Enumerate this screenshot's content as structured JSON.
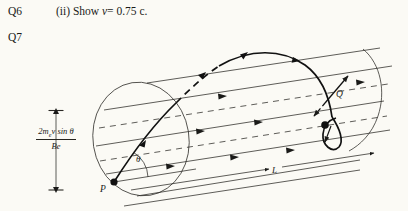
{
  "page": {
    "background_color": "#fbfaf5",
    "ink_color": "#1a1a18"
  },
  "questions": {
    "q6_label": "Q6",
    "q7_label": "Q7",
    "q6_part_prefix": "(ii) Show ",
    "q6_part_variable": "v",
    "q6_part_equals": "= 0.75 c."
  },
  "figure": {
    "formula": {
      "numerator_prefix": "2m",
      "numerator_subscript": "e",
      "numerator_suffix": "v sin θ",
      "denominator": "Be"
    },
    "labels": {
      "point_start": "P",
      "point_end": "Q",
      "angle": "θ",
      "length": "L"
    }
  }
}
